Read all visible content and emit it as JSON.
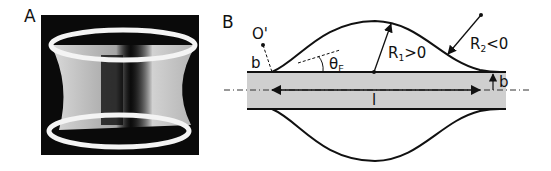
{
  "panels": {
    "a": {
      "label": "A",
      "description": "photograph of a ring-shaped film (catenoid-like) between two rings"
    },
    "b": {
      "label": "B"
    }
  },
  "diagram": {
    "labels": {
      "center": "O'",
      "b_left": "b",
      "b_right": "b",
      "theta": "θ",
      "theta_sub": "E",
      "r1": "R",
      "r1_sub": "1",
      "r1_cond": ">0",
      "r2": "R",
      "r2_sub": "2",
      "r2_cond": "<0",
      "length": "l"
    },
    "colors": {
      "rod_fill": "#cfcfcf",
      "stroke": "#111111",
      "photo_bg": "#0a0a0a"
    }
  }
}
